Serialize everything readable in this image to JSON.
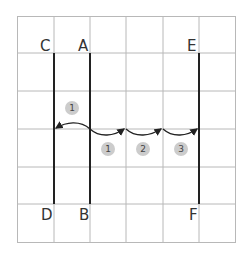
{
  "grid": {
    "cols": 6,
    "rows": 6,
    "line_color": "#b8b8b8"
  },
  "lines": [
    {
      "top": "C",
      "bottom": "D"
    },
    {
      "top": "A",
      "bottom": "B"
    },
    {
      "top": "E",
      "bottom": "F"
    }
  ],
  "labels": {
    "C": "C",
    "A": "A",
    "E": "E",
    "D": "D",
    "B": "B",
    "F": "F"
  },
  "steps": {
    "left": "1",
    "right": [
      "1",
      "2",
      "3"
    ]
  },
  "colors": {
    "line": "#222222",
    "badge": "#cccccc"
  }
}
